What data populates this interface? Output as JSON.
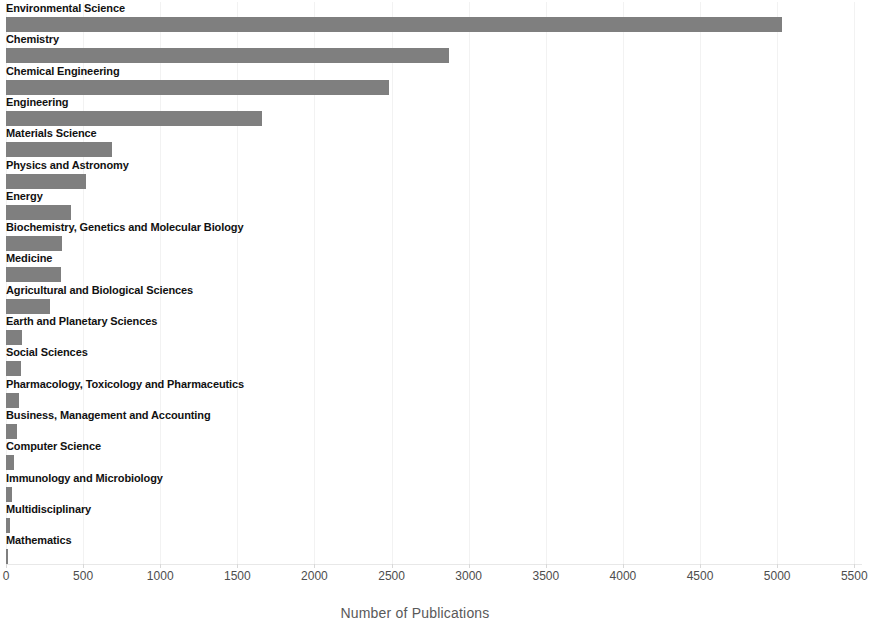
{
  "chart_data": {
    "type": "bar",
    "orientation": "horizontal",
    "title": "",
    "xlabel": "Number of Publications",
    "ylabel": "",
    "xlim": [
      0,
      5500
    ],
    "xticks": [
      0,
      500,
      1000,
      1500,
      2000,
      2500,
      3000,
      3500,
      4000,
      4500,
      5000,
      5500
    ],
    "xtick_labels": [
      "0",
      "500",
      "1000",
      "1500",
      "2000",
      "2500",
      "3000",
      "3500",
      "4000",
      "4500",
      "5000",
      "5500"
    ],
    "grid": true,
    "grid_axis": "x",
    "legend": false,
    "bar_color": "#7f7f7f",
    "label_color": "#111111",
    "tick_color": "#4d4d4d",
    "axis_title_color": "#595959",
    "categories": [
      "Environmental Science",
      "Chemistry",
      "Chemical Engineering",
      "Engineering",
      "Materials Science",
      "Physics and Astronomy",
      "Energy",
      "Biochemistry, Genetics and Molecular Biology",
      "Medicine",
      "Agricultural and Biological Sciences",
      "Earth and Planetary Sciences",
      "Social Sciences",
      "Pharmacology, Toxicology and Pharmaceutics",
      "Business, Management and Accounting",
      "Computer Science",
      "Immunology and Microbiology",
      "Multidisciplinary",
      "Mathematics"
    ],
    "values": [
      5030,
      2870,
      2480,
      1660,
      690,
      520,
      420,
      365,
      355,
      285,
      105,
      95,
      85,
      70,
      50,
      38,
      26,
      13
    ]
  }
}
